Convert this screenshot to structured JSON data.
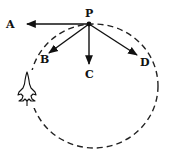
{
  "diagram": {
    "point_label": "P",
    "vectors": [
      {
        "id": "A",
        "label": "A",
        "direction": "left-horizontal"
      },
      {
        "id": "B",
        "label": "B",
        "direction": "down-left"
      },
      {
        "id": "C",
        "label": "C",
        "direction": "down-vertical"
      },
      {
        "id": "D",
        "label": "D",
        "direction": "down-right"
      }
    ],
    "path": "dashed-circular-loop",
    "object": "aircraft-icon",
    "colors": {
      "ink": "#111111",
      "background": "#ffffff"
    }
  }
}
